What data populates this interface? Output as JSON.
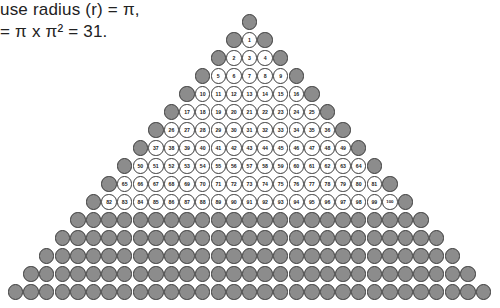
{
  "caption": {
    "line1": "use radius (r) = π,",
    "line2": "= π x π² = 31."
  },
  "colors": {
    "gray_fill": "#8c8c8c",
    "white_fill": "#ffffff",
    "border": "#3a3a3a"
  },
  "pyramid": {
    "total_rows": 16,
    "numbered_rows": [
      {
        "row": 1,
        "start": 1,
        "end": 1
      },
      {
        "row": 2,
        "start": 2,
        "end": 4
      },
      {
        "row": 3,
        "start": 5,
        "end": 9
      },
      {
        "row": 4,
        "start": 10,
        "end": 16
      },
      {
        "row": 5,
        "start": 17,
        "end": 25
      },
      {
        "row": 6,
        "start": 26,
        "end": 36
      },
      {
        "row": 7,
        "start": 37,
        "end": 49
      },
      {
        "row": 8,
        "start": 50,
        "end": 64
      },
      {
        "row": 9,
        "start": 65,
        "end": 81
      },
      {
        "row": 10,
        "start": 82,
        "end": 100
      }
    ],
    "gray_rows_below": 5,
    "top_center_x": 249.5,
    "top_center_y": 22,
    "row_pitch": 18,
    "col_pitch": 15.6
  }
}
